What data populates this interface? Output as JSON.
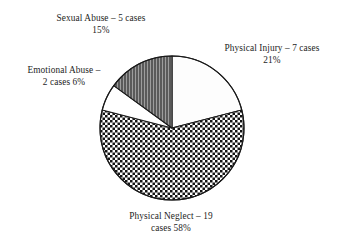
{
  "chart_data": {
    "type": "pie",
    "title": "",
    "subtitle": "",
    "xlabel": "",
    "ylabel": "",
    "legend_position": "none",
    "grid": false,
    "total_cases": 33,
    "categories": [
      "Physical Injury",
      "Physical Neglect",
      "Emotional Abuse",
      "Sexual Abuse"
    ],
    "values": [
      7,
      19,
      2,
      5
    ],
    "percentages": [
      21,
      58,
      6,
      15
    ],
    "slices": [
      {
        "name": "Physical Injury",
        "cases": 7,
        "percent": 21,
        "label_line1": "Physical Injury – 7 cases",
        "label_line2": "21%",
        "fill": "#fdfdfd",
        "pattern": "solid-light",
        "start_angle_deg": 0,
        "end_angle_deg": 75.6
      },
      {
        "name": "Physical Neglect",
        "cases": 19,
        "percent": 58,
        "label_line1": "Physical Neglect – 19",
        "label_line2": "cases 58%",
        "fill": "#ffffff",
        "pattern": "checkerboard",
        "start_angle_deg": 75.6,
        "end_angle_deg": 284.4
      },
      {
        "name": "Emotional Abuse",
        "cases": 2,
        "percent": 6,
        "label_line1": "Emotional Abuse –",
        "label_line2": "2 cases 6%",
        "fill": "#ffffff",
        "pattern": "solid-white",
        "start_angle_deg": 284.4,
        "end_angle_deg": 306.0
      },
      {
        "name": "Sexual Abuse",
        "cases": 5,
        "percent": 15,
        "label_line1": "Sexual Abuse – 5 cases",
        "label_line2": "15%",
        "fill": "#595959",
        "pattern": "vertical-stripes",
        "start_angle_deg": 306.0,
        "end_angle_deg": 360
      }
    ],
    "colors": {
      "outline": "#1a1a1a",
      "checker_dark": "#141414",
      "checker_light": "#ffffff",
      "stripe_base": "#5a5a5a",
      "stripe_line": "#9a9a9a",
      "light_slice": "#fdfdfd",
      "white_slice": "#ffffff",
      "text": "#1d1d1d",
      "background": "#ffffff"
    },
    "geometry": {
      "center_x": 172,
      "center_y": 128,
      "radius": 72
    }
  }
}
